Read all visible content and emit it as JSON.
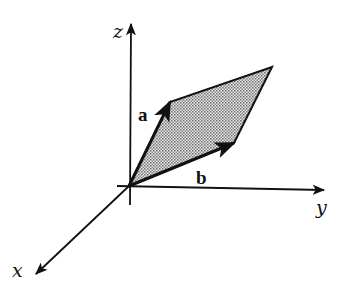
{
  "diagram": {
    "title": "",
    "axes": [
      {
        "name": "x",
        "label": "x"
      },
      {
        "name": "y",
        "label": "y"
      },
      {
        "name": "z",
        "label": "z"
      }
    ],
    "vectors": [
      {
        "name": "a",
        "label": "a"
      },
      {
        "name": "b",
        "label": "b"
      }
    ],
    "shape": "parallelogram spanned by vectors a and b (shaded)",
    "colors": {
      "stroke": "#111111",
      "fill_shade": "#b8b8b8",
      "background": "#ffffff"
    }
  }
}
